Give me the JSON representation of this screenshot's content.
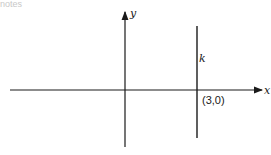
{
  "header": {
    "cropped_text": "notes"
  },
  "diagram": {
    "axes": {
      "x_label": "x",
      "y_label": "y"
    },
    "line": {
      "label": "k",
      "equation": "x = 3"
    },
    "point": {
      "label": "(3,0)",
      "x": 3,
      "y": 0
    },
    "colors": {
      "ink": "#1a1a1a",
      "background": "#ffffff"
    }
  }
}
